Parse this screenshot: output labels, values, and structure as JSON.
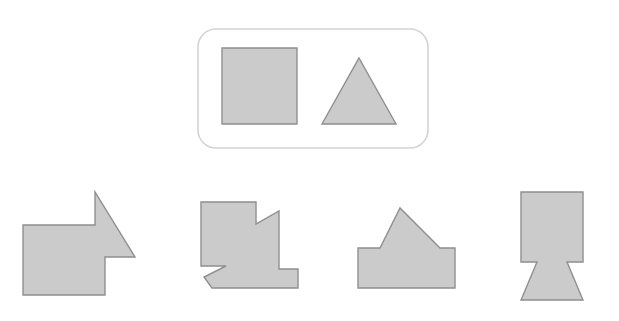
{
  "page": {
    "background_color": "#ffffff",
    "width": 619,
    "height": 321
  },
  "palette": {
    "shape_fill": "#cbcbcb",
    "shape_stroke": "#8f8f8f",
    "frame_stroke": "#d3d3d3",
    "background": "#ffffff"
  },
  "prompt_panel": {
    "name": "prompt-frame",
    "shape": "rounded-rectangle",
    "x": 198,
    "y": 29,
    "width": 230,
    "height": 119,
    "corner_radius": 18,
    "parts": [
      {
        "name": "square",
        "kind": "square",
        "points": "222,48 297,48 297,124 222,124"
      },
      {
        "name": "triangle",
        "kind": "triangle",
        "points": "359,58 396,124 322,124"
      }
    ]
  },
  "answer_options": [
    {
      "name": "option-a",
      "label": "A",
      "description": "square with triangle attached on upper-right edge",
      "points": "23,225 95,225 95,192 135,257 105,257 105,295 23,295"
    },
    {
      "name": "option-b",
      "label": "B",
      "description": "square with small triangle notch on right and triangle tab at bottom-left",
      "points": "201,202 256,202 256,224 279,211 279,269 298,269 298,288 212,288 204,277 226,266 201,266"
    },
    {
      "name": "option-c",
      "label": "C",
      "description": "wide rectangle with triangle on top, house-like",
      "points": "358,248 380,248 400,208 440,248 455,248 455,288 358,288"
    },
    {
      "name": "option-d",
      "label": "D",
      "description": "square with inverted triangle notches and downward triangle below",
      "points": "521,192 583,192 583,262 567,262 583,300 521,300 537,262 521,262"
    }
  ]
}
